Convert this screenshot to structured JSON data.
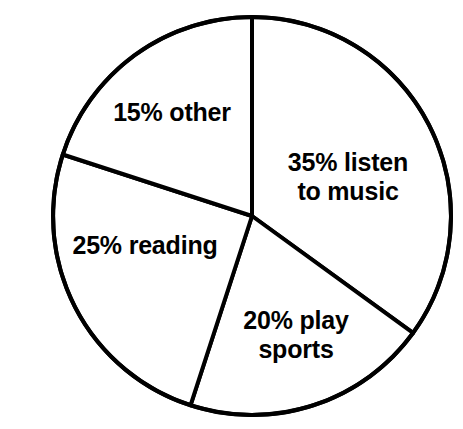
{
  "chart_data": {
    "type": "pie",
    "title": "",
    "subtitle": "",
    "xlabel": "",
    "ylabel": "",
    "legend_position": "none",
    "grid": false,
    "start_angle_deg": 0,
    "direction": "clockwise",
    "units": "percent",
    "total": 100,
    "categories": [
      "listen to music",
      "play sports",
      "reading",
      "other"
    ],
    "values": [
      35,
      20,
      25,
      15
    ],
    "slices": [
      {
        "label": "35% listen\nto music",
        "category": "listen to music",
        "value": 35,
        "percent_text": "35%",
        "start_angle_deg": 0,
        "end_angle_deg": 126,
        "fill": "#ffffff",
        "stroke": "#000000"
      },
      {
        "label": "20% play\nsports",
        "category": "play sports",
        "value": 20,
        "percent_text": "20%",
        "start_angle_deg": 126,
        "end_angle_deg": 198,
        "fill": "#ffffff",
        "stroke": "#000000"
      },
      {
        "label": "25% reading",
        "category": "reading",
        "value": 25,
        "percent_text": "25%",
        "start_angle_deg": 198,
        "end_angle_deg": 288,
        "fill": "#ffffff",
        "stroke": "#000000"
      },
      {
        "label": "15% other",
        "category": "other",
        "value": 15,
        "percent_text": "15%",
        "start_angle_deg": 288,
        "end_angle_deg": 360,
        "fill": "#ffffff",
        "stroke": "#000000"
      }
    ]
  },
  "geometry": {
    "center_x": 252,
    "center_y": 216,
    "radius": 199,
    "stroke_width": 4
  },
  "colors": {
    "background": "#ffffff",
    "outline": "#000000",
    "label_text": "#000000",
    "slice_fill": "#ffffff"
  }
}
